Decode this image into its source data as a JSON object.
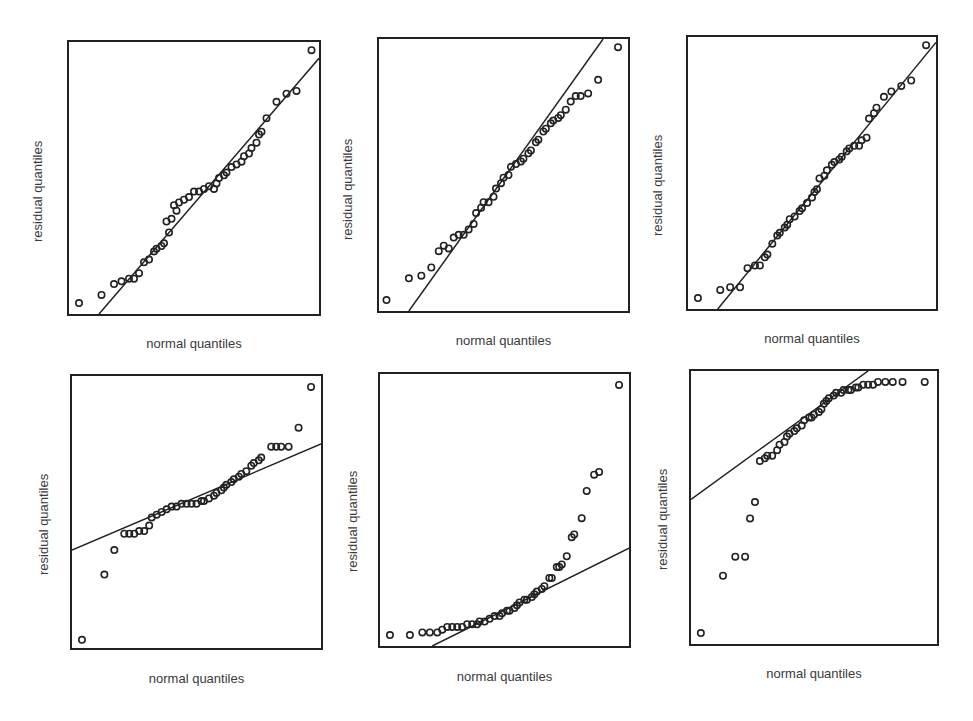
{
  "chart_data": [
    {
      "type": "scatter",
      "title": "",
      "xlabel": "normal quantiles",
      "ylabel": "residual quantiles",
      "grid": false,
      "box": {
        "left": 67,
        "top": 40,
        "width": 254,
        "height": 276
      },
      "reference_line": {
        "x1": 0.12,
        "y1": 0.0,
        "x2": 1.0,
        "y2": 0.94
      },
      "points": [
        [
          0.04,
          0.04
        ],
        [
          0.13,
          0.07
        ],
        [
          0.18,
          0.11
        ],
        [
          0.21,
          0.12
        ],
        [
          0.24,
          0.13
        ],
        [
          0.26,
          0.13
        ],
        [
          0.28,
          0.15
        ],
        [
          0.3,
          0.19
        ],
        [
          0.32,
          0.2
        ],
        [
          0.34,
          0.23
        ],
        [
          0.35,
          0.24
        ],
        [
          0.37,
          0.25
        ],
        [
          0.38,
          0.26
        ],
        [
          0.4,
          0.3
        ],
        [
          0.39,
          0.34
        ],
        [
          0.41,
          0.35
        ],
        [
          0.43,
          0.38
        ],
        [
          0.42,
          0.4
        ],
        [
          0.44,
          0.41
        ],
        [
          0.46,
          0.42
        ],
        [
          0.48,
          0.43
        ],
        [
          0.5,
          0.45
        ],
        [
          0.52,
          0.45
        ],
        [
          0.54,
          0.46
        ],
        [
          0.56,
          0.47
        ],
        [
          0.58,
          0.46
        ],
        [
          0.59,
          0.48
        ],
        [
          0.6,
          0.5
        ],
        [
          0.62,
          0.51
        ],
        [
          0.63,
          0.52
        ],
        [
          0.65,
          0.54
        ],
        [
          0.67,
          0.55
        ],
        [
          0.69,
          0.56
        ],
        [
          0.7,
          0.58
        ],
        [
          0.72,
          0.59
        ],
        [
          0.73,
          0.61
        ],
        [
          0.75,
          0.63
        ],
        [
          0.76,
          0.66
        ],
        [
          0.77,
          0.67
        ],
        [
          0.79,
          0.72
        ],
        [
          0.83,
          0.78
        ],
        [
          0.87,
          0.81
        ],
        [
          0.91,
          0.82
        ],
        [
          0.97,
          0.97
        ]
      ]
    },
    {
      "type": "scatter",
      "title": "",
      "xlabel": "normal quantiles",
      "ylabel": "residual quantiles",
      "grid": false,
      "box": {
        "left": 377,
        "top": 37,
        "width": 253,
        "height": 276
      },
      "reference_line": {
        "x1": 0.12,
        "y1": 0.0,
        "x2": 0.9,
        "y2": 1.0
      },
      "points": [
        [
          0.03,
          0.04
        ],
        [
          0.12,
          0.12
        ],
        [
          0.17,
          0.13
        ],
        [
          0.21,
          0.16
        ],
        [
          0.24,
          0.22
        ],
        [
          0.26,
          0.24
        ],
        [
          0.28,
          0.23
        ],
        [
          0.3,
          0.27
        ],
        [
          0.32,
          0.28
        ],
        [
          0.34,
          0.28
        ],
        [
          0.36,
          0.3
        ],
        [
          0.38,
          0.32
        ],
        [
          0.39,
          0.36
        ],
        [
          0.41,
          0.38
        ],
        [
          0.42,
          0.4
        ],
        [
          0.44,
          0.4
        ],
        [
          0.46,
          0.42
        ],
        [
          0.47,
          0.45
        ],
        [
          0.49,
          0.47
        ],
        [
          0.5,
          0.49
        ],
        [
          0.52,
          0.5
        ],
        [
          0.53,
          0.53
        ],
        [
          0.55,
          0.54
        ],
        [
          0.57,
          0.55
        ],
        [
          0.58,
          0.56
        ],
        [
          0.6,
          0.58
        ],
        [
          0.61,
          0.59
        ],
        [
          0.63,
          0.62
        ],
        [
          0.64,
          0.63
        ],
        [
          0.66,
          0.66
        ],
        [
          0.67,
          0.67
        ],
        [
          0.69,
          0.69
        ],
        [
          0.7,
          0.7
        ],
        [
          0.72,
          0.71
        ],
        [
          0.73,
          0.72
        ],
        [
          0.75,
          0.74
        ],
        [
          0.77,
          0.77
        ],
        [
          0.79,
          0.79
        ],
        [
          0.81,
          0.79
        ],
        [
          0.84,
          0.8
        ],
        [
          0.88,
          0.85
        ],
        [
          0.96,
          0.97
        ]
      ]
    },
    {
      "type": "scatter",
      "title": "",
      "xlabel": "normal quantiles",
      "ylabel": "residual quantiles",
      "grid": false,
      "box": {
        "left": 686,
        "top": 35,
        "width": 252,
        "height": 276
      },
      "reference_line": {
        "x1": 0.12,
        "y1": 0.0,
        "x2": 1.0,
        "y2": 0.98
      },
      "points": [
        [
          0.04,
          0.04
        ],
        [
          0.13,
          0.07
        ],
        [
          0.17,
          0.08
        ],
        [
          0.21,
          0.08
        ],
        [
          0.24,
          0.15
        ],
        [
          0.27,
          0.16
        ],
        [
          0.29,
          0.16
        ],
        [
          0.31,
          0.19
        ],
        [
          0.32,
          0.2
        ],
        [
          0.34,
          0.24
        ],
        [
          0.36,
          0.27
        ],
        [
          0.37,
          0.28
        ],
        [
          0.39,
          0.3
        ],
        [
          0.4,
          0.31
        ],
        [
          0.41,
          0.33
        ],
        [
          0.43,
          0.34
        ],
        [
          0.45,
          0.36
        ],
        [
          0.46,
          0.37
        ],
        [
          0.48,
          0.39
        ],
        [
          0.5,
          0.41
        ],
        [
          0.51,
          0.43
        ],
        [
          0.52,
          0.44
        ],
        [
          0.53,
          0.48
        ],
        [
          0.55,
          0.49
        ],
        [
          0.56,
          0.51
        ],
        [
          0.58,
          0.53
        ],
        [
          0.59,
          0.54
        ],
        [
          0.61,
          0.55
        ],
        [
          0.62,
          0.56
        ],
        [
          0.64,
          0.58
        ],
        [
          0.65,
          0.59
        ],
        [
          0.67,
          0.6
        ],
        [
          0.69,
          0.6
        ],
        [
          0.7,
          0.62
        ],
        [
          0.72,
          0.63
        ],
        [
          0.73,
          0.7
        ],
        [
          0.75,
          0.72
        ],
        [
          0.76,
          0.74
        ],
        [
          0.79,
          0.78
        ],
        [
          0.82,
          0.8
        ],
        [
          0.86,
          0.82
        ],
        [
          0.9,
          0.84
        ],
        [
          0.96,
          0.97
        ]
      ]
    },
    {
      "type": "scatter",
      "title": "",
      "xlabel": "normal quantiles",
      "ylabel": "residual quantiles",
      "grid": false,
      "box": {
        "left": 70,
        "top": 374,
        "width": 253,
        "height": 276
      },
      "reference_line": {
        "x1": 0.0,
        "y1": 0.36,
        "x2": 1.0,
        "y2": 0.75
      },
      "points": [
        [
          0.04,
          0.03
        ],
        [
          0.13,
          0.27
        ],
        [
          0.17,
          0.36
        ],
        [
          0.21,
          0.42
        ],
        [
          0.23,
          0.42
        ],
        [
          0.25,
          0.42
        ],
        [
          0.27,
          0.43
        ],
        [
          0.29,
          0.43
        ],
        [
          0.31,
          0.45
        ],
        [
          0.32,
          0.48
        ],
        [
          0.34,
          0.49
        ],
        [
          0.36,
          0.5
        ],
        [
          0.38,
          0.51
        ],
        [
          0.4,
          0.52
        ],
        [
          0.42,
          0.52
        ],
        [
          0.44,
          0.53
        ],
        [
          0.46,
          0.53
        ],
        [
          0.48,
          0.53
        ],
        [
          0.5,
          0.53
        ],
        [
          0.52,
          0.54
        ],
        [
          0.53,
          0.54
        ],
        [
          0.55,
          0.55
        ],
        [
          0.57,
          0.56
        ],
        [
          0.58,
          0.57
        ],
        [
          0.6,
          0.58
        ],
        [
          0.61,
          0.59
        ],
        [
          0.62,
          0.6
        ],
        [
          0.64,
          0.61
        ],
        [
          0.65,
          0.62
        ],
        [
          0.67,
          0.63
        ],
        [
          0.68,
          0.64
        ],
        [
          0.7,
          0.65
        ],
        [
          0.72,
          0.67
        ],
        [
          0.73,
          0.68
        ],
        [
          0.75,
          0.69
        ],
        [
          0.76,
          0.7
        ],
        [
          0.8,
          0.74
        ],
        [
          0.82,
          0.74
        ],
        [
          0.84,
          0.74
        ],
        [
          0.87,
          0.74
        ],
        [
          0.91,
          0.81
        ],
        [
          0.96,
          0.96
        ]
      ]
    },
    {
      "type": "scatter",
      "title": "",
      "xlabel": "normal quantiles",
      "ylabel": "residual quantiles",
      "grid": false,
      "box": {
        "left": 378,
        "top": 372,
        "width": 253,
        "height": 276
      },
      "reference_line": {
        "x1": 0.21,
        "y1": 0.0,
        "x2": 1.0,
        "y2": 0.36
      },
      "points": [
        [
          0.04,
          0.04
        ],
        [
          0.12,
          0.04
        ],
        [
          0.17,
          0.05
        ],
        [
          0.2,
          0.05
        ],
        [
          0.23,
          0.05
        ],
        [
          0.25,
          0.06
        ],
        [
          0.27,
          0.07
        ],
        [
          0.29,
          0.07
        ],
        [
          0.31,
          0.07
        ],
        [
          0.33,
          0.07
        ],
        [
          0.35,
          0.08
        ],
        [
          0.37,
          0.08
        ],
        [
          0.39,
          0.08
        ],
        [
          0.4,
          0.09
        ],
        [
          0.42,
          0.09
        ],
        [
          0.44,
          0.1
        ],
        [
          0.46,
          0.11
        ],
        [
          0.48,
          0.11
        ],
        [
          0.49,
          0.12
        ],
        [
          0.51,
          0.13
        ],
        [
          0.52,
          0.13
        ],
        [
          0.54,
          0.14
        ],
        [
          0.55,
          0.15
        ],
        [
          0.56,
          0.16
        ],
        [
          0.58,
          0.17
        ],
        [
          0.59,
          0.17
        ],
        [
          0.61,
          0.18
        ],
        [
          0.62,
          0.19
        ],
        [
          0.63,
          0.2
        ],
        [
          0.65,
          0.21
        ],
        [
          0.66,
          0.22
        ],
        [
          0.68,
          0.25
        ],
        [
          0.69,
          0.25
        ],
        [
          0.71,
          0.29
        ],
        [
          0.72,
          0.29
        ],
        [
          0.73,
          0.3
        ],
        [
          0.75,
          0.33
        ],
        [
          0.77,
          0.4
        ],
        [
          0.78,
          0.41
        ],
        [
          0.81,
          0.47
        ],
        [
          0.83,
          0.57
        ],
        [
          0.86,
          0.63
        ],
        [
          0.88,
          0.64
        ],
        [
          0.96,
          0.96
        ]
      ]
    },
    {
      "type": "scatter",
      "title": "",
      "xlabel": "normal quantiles",
      "ylabel": "residual quantiles",
      "grid": false,
      "box": {
        "left": 689,
        "top": 369,
        "width": 250,
        "height": 277
      },
      "reference_line": {
        "x1": 0.0,
        "y1": 0.53,
        "x2": 0.72,
        "y2": 1.0
      },
      "points": [
        [
          0.04,
          0.04
        ],
        [
          0.13,
          0.25
        ],
        [
          0.18,
          0.32
        ],
        [
          0.22,
          0.32
        ],
        [
          0.24,
          0.46
        ],
        [
          0.26,
          0.52
        ],
        [
          0.28,
          0.67
        ],
        [
          0.3,
          0.68
        ],
        [
          0.31,
          0.69
        ],
        [
          0.33,
          0.69
        ],
        [
          0.35,
          0.71
        ],
        [
          0.36,
          0.73
        ],
        [
          0.38,
          0.74
        ],
        [
          0.39,
          0.76
        ],
        [
          0.4,
          0.77
        ],
        [
          0.42,
          0.78
        ],
        [
          0.43,
          0.79
        ],
        [
          0.45,
          0.8
        ],
        [
          0.46,
          0.82
        ],
        [
          0.48,
          0.83
        ],
        [
          0.49,
          0.83
        ],
        [
          0.5,
          0.84
        ],
        [
          0.52,
          0.85
        ],
        [
          0.53,
          0.86
        ],
        [
          0.54,
          0.88
        ],
        [
          0.55,
          0.89
        ],
        [
          0.56,
          0.9
        ],
        [
          0.58,
          0.91
        ],
        [
          0.59,
          0.92
        ],
        [
          0.61,
          0.92
        ],
        [
          0.62,
          0.93
        ],
        [
          0.64,
          0.93
        ],
        [
          0.65,
          0.93
        ],
        [
          0.67,
          0.94
        ],
        [
          0.68,
          0.94
        ],
        [
          0.7,
          0.95
        ],
        [
          0.72,
          0.95
        ],
        [
          0.74,
          0.95
        ],
        [
          0.76,
          0.96
        ],
        [
          0.79,
          0.96
        ],
        [
          0.82,
          0.96
        ],
        [
          0.86,
          0.96
        ],
        [
          0.95,
          0.96
        ]
      ]
    }
  ],
  "panels": [
    {
      "xlabel": "normal quantiles",
      "ylabel": "residual quantiles"
    },
    {
      "xlabel": "normal quantiles",
      "ylabel": "residual quantiles"
    },
    {
      "xlabel": "normal quantiles",
      "ylabel": "residual quantiles"
    },
    {
      "xlabel": "normal quantiles",
      "ylabel": "residual quantiles"
    },
    {
      "xlabel": "normal quantiles",
      "ylabel": "residual quantiles"
    },
    {
      "xlabel": "normal quantiles",
      "ylabel": "residual quantiles"
    }
  ],
  "style": {
    "marker_color": "#222222",
    "line_color": "#222222",
    "frame_color": "#222222"
  }
}
